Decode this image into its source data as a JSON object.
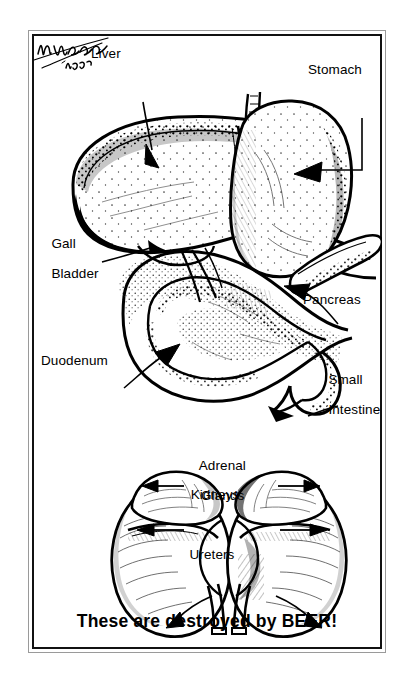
{
  "poster": {
    "title": "Anatomical illustration of digestive and urinary organs",
    "caption": "These are destroyed by BEER!",
    "background_color": "#ffffff",
    "ink_color": "#000000",
    "frame": {
      "style": "double-line rectangle",
      "outer_color": "#9a9a9a",
      "inner_color": "#111111"
    },
    "signature": {
      "artist_mark": "H. Wheeler",
      "year": "1973"
    }
  },
  "labels": {
    "liver": "Liver",
    "stomach": "Stomach",
    "gall_bladder_line1": "Gall",
    "gall_bladder_line2": "Bladder",
    "pancreas": "Pancreas",
    "duodenum": "Duodenum",
    "small_intestine_line1": "Small",
    "small_intestine_line2": "Intestine",
    "adrenal_line1": "Adrenal",
    "adrenal_line2": "Glands",
    "kidneys": "Kidneys",
    "ureters": "Ureters"
  },
  "figures": {
    "upper": {
      "name": "digestive-organs-figure",
      "organs": [
        "Liver",
        "Stomach",
        "Gall Bladder",
        "Pancreas",
        "Duodenum",
        "Small Intestine"
      ]
    },
    "lower": {
      "name": "urinary-organs-figure",
      "organs": [
        "Adrenal Glands",
        "Kidneys",
        "Ureters"
      ]
    }
  }
}
